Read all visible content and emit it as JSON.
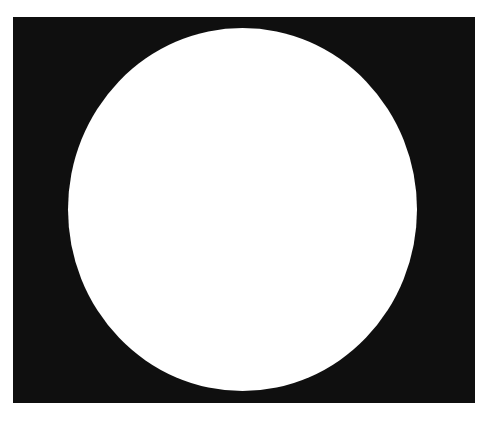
{
  "figure": {
    "shapes": [
      {
        "kind": "rectangle",
        "role": "background",
        "color": "#0f0f0f"
      },
      {
        "kind": "ellipse",
        "role": "foreground",
        "color": "#ffffff"
      }
    ],
    "colors": {
      "page": "#ffffff",
      "frame": "#0f0f0f",
      "disc": "#ffffff"
    }
  }
}
